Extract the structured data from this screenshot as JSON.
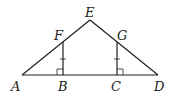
{
  "diagram": {
    "type": "geometry-figure",
    "points": [
      {
        "id": "A",
        "label": "A",
        "x": 22,
        "y": 75,
        "lx": 11,
        "ly": 91
      },
      {
        "id": "B",
        "label": "B",
        "x": 63,
        "y": 75,
        "lx": 58,
        "ly": 91
      },
      {
        "id": "C",
        "label": "C",
        "x": 117,
        "y": 75,
        "lx": 111,
        "ly": 91
      },
      {
        "id": "D",
        "label": "D",
        "x": 158,
        "y": 75,
        "lx": 154,
        "ly": 91
      },
      {
        "id": "E",
        "label": "E",
        "x": 90,
        "y": 20,
        "lx": 84,
        "ly": 17
      },
      {
        "id": "F",
        "label": "F",
        "x": 63,
        "y": 42,
        "lx": 54,
        "ly": 40
      },
      {
        "id": "G",
        "label": "G",
        "x": 117,
        "y": 42,
        "lx": 117,
        "ly": 40
      }
    ],
    "segments": [
      "AE",
      "ED",
      "AD",
      "FB",
      "GC"
    ],
    "right_angles": [
      "FBA",
      "GCD"
    ],
    "congruent_marks": [
      "FB",
      "GC"
    ],
    "labels": {
      "A": "A",
      "B": "B",
      "C": "C",
      "D": "D",
      "E": "E",
      "F": "F",
      "G": "G"
    }
  }
}
